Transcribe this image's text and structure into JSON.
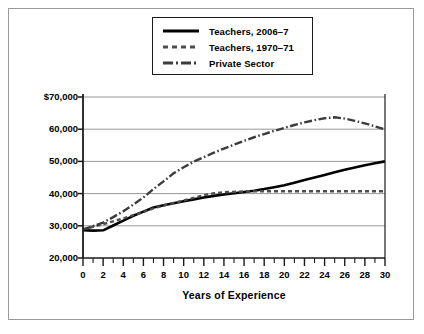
{
  "chart_data": {
    "type": "line",
    "title": "",
    "xlabel": "Years of Experience",
    "ylabel": "",
    "xlim": [
      0,
      30
    ],
    "ylim": [
      20000,
      70000
    ],
    "grid": true,
    "legend_position": "top-center",
    "x_tick_labels": [
      "0",
      "2",
      "4",
      "6",
      "8",
      "10",
      "12",
      "14",
      "16",
      "18",
      "20",
      "22",
      "24",
      "26",
      "28",
      "30"
    ],
    "x_ticks": [
      0,
      2,
      4,
      6,
      8,
      10,
      12,
      14,
      16,
      18,
      20,
      22,
      24,
      26,
      28,
      30
    ],
    "x_minor_ticks": [
      1,
      3,
      5,
      7,
      9,
      11,
      13,
      15,
      17,
      19,
      21,
      23,
      25,
      27,
      29
    ],
    "y_tick_labels": [
      "$70,000",
      "60,000",
      "50,000",
      "40,000",
      "30,000",
      "20,000"
    ],
    "y_ticks": [
      70000,
      60000,
      50000,
      40000,
      30000,
      20000
    ],
    "x": [
      0,
      1,
      2,
      3,
      4,
      5,
      6,
      7,
      8,
      9,
      10,
      11,
      12,
      13,
      14,
      15,
      16,
      17,
      18,
      19,
      20,
      21,
      22,
      23,
      24,
      25,
      26,
      27,
      28,
      29,
      30
    ],
    "series": [
      {
        "name": "Teachers, 2006–7",
        "style": "solid",
        "color": "#000000",
        "values": [
          28600,
          28500,
          28600,
          30100,
          31600,
          33100,
          34400,
          35700,
          36400,
          37000,
          37600,
          38200,
          38800,
          39300,
          39700,
          40100,
          40500,
          40900,
          41400,
          42000,
          42600,
          43400,
          44200,
          45000,
          45800,
          46600,
          47400,
          48100,
          48800,
          49400,
          50000
        ]
      },
      {
        "name": "Teachers, 1970–71",
        "style": "dashed",
        "color": "#4d4d4d",
        "values": [
          28900,
          29700,
          30500,
          31400,
          32300,
          33300,
          34300,
          35400,
          36300,
          37100,
          37900,
          38700,
          39500,
          40100,
          40400,
          40550,
          40650,
          40700,
          40750,
          40750,
          40750,
          40750,
          40750,
          40750,
          40750,
          40750,
          40750,
          40750,
          40750,
          40750,
          40750
        ]
      },
      {
        "name": "Private Sector",
        "style": "dash-dot",
        "color": "#3c3c3c",
        "values": [
          28800,
          29900,
          31000,
          32700,
          34500,
          36600,
          38800,
          41400,
          43800,
          46300,
          48200,
          49900,
          51300,
          52700,
          54000,
          55200,
          56400,
          57500,
          58500,
          59500,
          60400,
          61300,
          62100,
          62800,
          63400,
          63700,
          63300,
          62600,
          61800,
          60900,
          59900
        ]
      }
    ]
  },
  "legend": {
    "items": [
      {
        "label": "Teachers, 2006–7"
      },
      {
        "label": "Teachers, 1970–71"
      },
      {
        "label": "Private Sector"
      }
    ]
  },
  "axis": {
    "x_title": "Years of Experience"
  }
}
